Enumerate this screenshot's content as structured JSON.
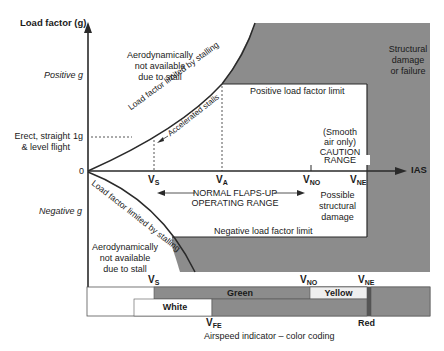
{
  "diagram": {
    "title_y_axis": "Load factor (g)",
    "x_axis_label": "IAS",
    "positive_g": "Positive g",
    "negative_g": "Negative g",
    "erect_flight": [
      "Erect, straight",
      "& level flight"
    ],
    "one_g": "1g",
    "zero": "0",
    "aero_na_top": [
      "Aerodynamically",
      "not available",
      "due to stall"
    ],
    "aero_na_bottom": [
      "Aerodynamically",
      "not available",
      "due to stall"
    ],
    "curve_top_label": "Load factor limited by stalling",
    "curve_top_sub_label": "Accelerated stalls",
    "curve_bottom_label": "Load factor limited by stalling",
    "structural_damage": [
      "Structural",
      "damage",
      "or failure"
    ],
    "positive_limit": "Positive load factor limit",
    "negative_limit": "Negative load factor limit",
    "caution": [
      "(Smooth",
      "air only)",
      "CAUTION",
      "RANGE"
    ],
    "normal_range": [
      "NORMAL FLAPS-UP",
      "OPERATING RANGE"
    ],
    "possible_damage": [
      "Possible",
      "structural",
      "damage"
    ],
    "speeds": {
      "vs": {
        "main": "V",
        "sub": "S"
      },
      "va": {
        "main": "V",
        "sub": "A"
      },
      "vno": {
        "main": "V",
        "sub": "NO"
      },
      "vne": {
        "main": "V",
        "sub": "NE"
      },
      "vfe": {
        "main": "V",
        "sub": "FE"
      }
    }
  },
  "airspeed_bar": {
    "green": "Green",
    "white": "White",
    "yellow": "Yellow",
    "red": "Red",
    "caption": "Airspeed indicator – color coding"
  },
  "colors": {
    "shade": "#8c8c8c",
    "line": "#2a2a2a",
    "white_band": "#ffffff",
    "yellow_band": "#efefef",
    "red_mark": "#555555"
  }
}
